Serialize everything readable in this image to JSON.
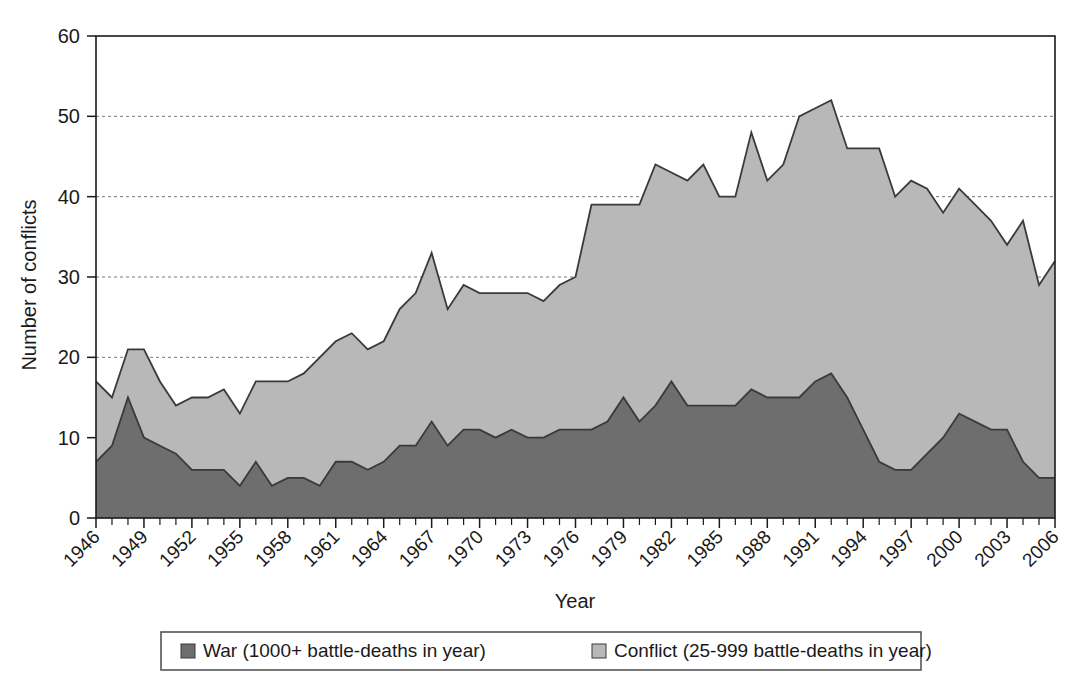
{
  "chart_data": {
    "type": "area",
    "title": "",
    "subtitle": "",
    "xlabel": "Year",
    "ylabel": "Number of conflicts",
    "stacked": true,
    "grid": true,
    "grid_axis": "y",
    "legend_position": "bottom",
    "xlim": [
      1946,
      2006
    ],
    "ylim": [
      0,
      60
    ],
    "y_ticks": [
      0,
      10,
      20,
      30,
      40,
      50,
      60
    ],
    "x_tick_labels": [
      "1946",
      "1949",
      "1952",
      "1955",
      "1958",
      "1961",
      "1964",
      "1967",
      "1970",
      "1973",
      "1976",
      "1979",
      "1982",
      "1985",
      "1988",
      "1991",
      "1994",
      "1997",
      "2000",
      "2003",
      "2006"
    ],
    "x_tick_step": 3,
    "x_minor_step": 1,
    "colors": {
      "war": "#6e6e6e",
      "conflict": "#b8b8b8",
      "outline": "#3a3a3a",
      "axis": "#1a1a1a",
      "grid": "#777777",
      "background": "#ffffff"
    },
    "x": [
      1946,
      1947,
      1948,
      1949,
      1950,
      1951,
      1952,
      1953,
      1954,
      1955,
      1956,
      1957,
      1958,
      1959,
      1960,
      1961,
      1962,
      1963,
      1964,
      1965,
      1966,
      1967,
      1968,
      1969,
      1970,
      1971,
      1972,
      1973,
      1974,
      1975,
      1976,
      1977,
      1978,
      1979,
      1980,
      1981,
      1982,
      1983,
      1984,
      1985,
      1986,
      1987,
      1988,
      1989,
      1990,
      1991,
      1992,
      1993,
      1994,
      1995,
      1996,
      1997,
      1998,
      1999,
      2000,
      2001,
      2002,
      2003,
      2004,
      2005,
      2006
    ],
    "series": [
      {
        "name": "War (1000+ battle-deaths in year)",
        "key": "war",
        "color": "#6e6e6e",
        "values": [
          7,
          9,
          15,
          10,
          9,
          8,
          6,
          6,
          6,
          4,
          7,
          4,
          5,
          5,
          4,
          7,
          7,
          6,
          7,
          9,
          9,
          12,
          9,
          11,
          11,
          10,
          11,
          10,
          10,
          11,
          11,
          11,
          12,
          15,
          12,
          14,
          17,
          14,
          14,
          14,
          14,
          16,
          15,
          15,
          15,
          17,
          18,
          15,
          11,
          7,
          6,
          6,
          8,
          10,
          13,
          12,
          11,
          11,
          7,
          5,
          5
        ]
      },
      {
        "name": "Conflict (25-999 battle-deaths in year)",
        "key": "conflict",
        "color": "#b8b8b8",
        "values": [
          10,
          6,
          6,
          11,
          8,
          6,
          9,
          9,
          10,
          9,
          10,
          13,
          12,
          13,
          16,
          15,
          16,
          15,
          15,
          17,
          19,
          21,
          17,
          18,
          17,
          18,
          17,
          18,
          17,
          18,
          19,
          28,
          27,
          24,
          27,
          30,
          26,
          28,
          30,
          26,
          26,
          32,
          27,
          29,
          35,
          34,
          34,
          31,
          35,
          39,
          34,
          36,
          33,
          28,
          28,
          27,
          26,
          23,
          30,
          24,
          27
        ]
      }
    ],
    "totals": [
      17,
      15,
      21,
      21,
      17,
      14,
      15,
      15,
      16,
      13,
      17,
      17,
      17,
      18,
      20,
      22,
      23,
      21,
      22,
      26,
      28,
      33,
      26,
      29,
      28,
      28,
      28,
      28,
      27,
      29,
      30,
      39,
      39,
      39,
      39,
      44,
      43,
      42,
      44,
      40,
      40,
      48,
      42,
      44,
      50,
      51,
      52,
      46,
      46,
      46,
      40,
      42,
      41,
      38,
      41,
      39,
      37,
      34,
      37,
      29,
      32
    ]
  },
  "legend": {
    "items": [
      {
        "label": "War (1000+ battle-deaths in year)",
        "swatch": "#6e6e6e"
      },
      {
        "label": "Conflict (25-999 battle-deaths in year)",
        "swatch": "#b8b8b8"
      }
    ]
  },
  "axes": {
    "y_title": "Number of conflicts",
    "x_title": "Year"
  }
}
